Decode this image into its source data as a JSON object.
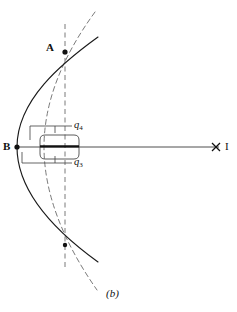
{
  "figure": {
    "caption": "(b)",
    "type": "optics-ray-diagram",
    "background_color": "#ffffff",
    "stroke_color": "#111111",
    "thin_stroke_color": "#4a4a4a",
    "labels": {
      "point_a": "A",
      "point_b": "B",
      "image_point": "I",
      "charge_upper": "q",
      "charge_upper_sub": "4",
      "charge_lower": "q",
      "charge_lower_sub": "3"
    },
    "geometry": {
      "point_a": {
        "x": 65,
        "y": 52
      },
      "point_b": {
        "x": 17,
        "y": 147
      },
      "point_bottom": {
        "x": 65,
        "y": 245
      },
      "image_mark": {
        "x": 216,
        "y": 147
      },
      "optical_axis": {
        "x1": 17,
        "y1": 147,
        "x2": 219,
        "y2": 147
      },
      "vertical_dashed_axis": {
        "x": 65,
        "y1": 24,
        "y2": 268
      },
      "solid_arc": {
        "start_x": 98,
        "start_y": 37,
        "apex_x": 17,
        "apex_y": 147,
        "end_x": 98,
        "end_y": 262
      },
      "dashed_arc": {
        "start_x": 95,
        "start_y": 12,
        "apex_x": 44,
        "apex_y": 147,
        "end_x": 97,
        "end_y": 290
      },
      "lens_body": {
        "x": 41,
        "y": 135,
        "width": 38,
        "height": 24
      },
      "leader_q4": {
        "x1": 55,
        "y1": 126,
        "x2": 72,
        "y2": 126
      },
      "leader_q3": {
        "x1": 55,
        "y1": 163,
        "x2": 72,
        "y2": 163
      }
    }
  }
}
